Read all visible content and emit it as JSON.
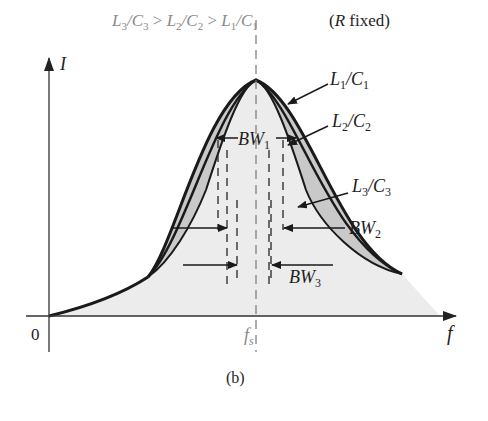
{
  "figure": {
    "panel_label": "(b)",
    "header": {
      "condition": "L3/C3 > L2/C2 > L1/C1",
      "note": "(R fixed)"
    },
    "axes": {
      "y_label": "I",
      "x_label": "f",
      "origin_label": "0",
      "center_tick_label": "fs"
    },
    "curves": [
      {
        "id": "c1",
        "label": "L1/C1",
        "label_main": "L",
        "label_sub1": "1",
        "label_mid": "/C",
        "label_sub2": "1",
        "bandwidth": "BW1",
        "relative_width": "widest"
      },
      {
        "id": "c2",
        "label": "L2/C2",
        "label_main": "L",
        "label_sub1": "2",
        "label_mid": "/C",
        "label_sub2": "2",
        "bandwidth": "BW2",
        "relative_width": "middle"
      },
      {
        "id": "c3",
        "label": "L3/C3",
        "label_main": "L",
        "label_sub1": "3",
        "label_mid": "/C",
        "label_sub2": "3",
        "bandwidth": "BW3",
        "relative_width": "narrowest"
      }
    ],
    "bandwidth_labels": {
      "bw1_main": "BW",
      "bw1_sub": "1",
      "bw2_main": "BW",
      "bw2_sub": "2",
      "bw3_main": "BW",
      "bw3_sub": "3"
    },
    "header_parts": {
      "l3": "L",
      "s3a": "3",
      "c3": "/C",
      "s3b": "3",
      "gt1": " > ",
      "l2": "L",
      "s2a": "2",
      "c2": "/C",
      "s2b": "2",
      "gt2": " > ",
      "l1": "L",
      "s1a": "1",
      "c1": "/C",
      "s1b": "1",
      "note_open": "(",
      "note_r": "R",
      "note_rest": " fixed)"
    },
    "fs_main": "f",
    "fs_sub": "s",
    "colors": {
      "curve": "#1a1a1a",
      "band_fill": "#c9c9c9",
      "under_fill": "#ececec",
      "axis": "#333333",
      "label_gray": "#8a8a8a"
    }
  }
}
